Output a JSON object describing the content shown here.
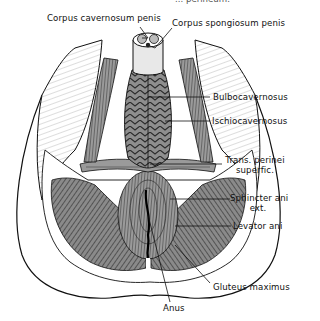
{
  "figure": {
    "type": "anatomical line drawing",
    "truncated_caption": "... perineum."
  },
  "labels": {
    "corpus_cavernosum": "Corpus cavernosum penis",
    "corpus_spongiosum": "Corpus spongiosum penis",
    "bulbocavernosus": "Bulbocavernosus",
    "ischiocavernosus": "Ischiocavernosus",
    "trans_perinei_1": "Trans. perinei",
    "trans_perinei_2": "superfic.",
    "sphincter_ani_1": "Sphincter ani",
    "sphincter_ani_2": "ext.",
    "levator_ani": "Levator ani",
    "gluteus_maximus": "Gluteus maximus",
    "anus": "Anus"
  },
  "colors": {
    "ink": "#111111",
    "muscle_fill": "#6e6e6e",
    "muscle_dark": "#3a3a3a",
    "background": "#ffffff"
  }
}
